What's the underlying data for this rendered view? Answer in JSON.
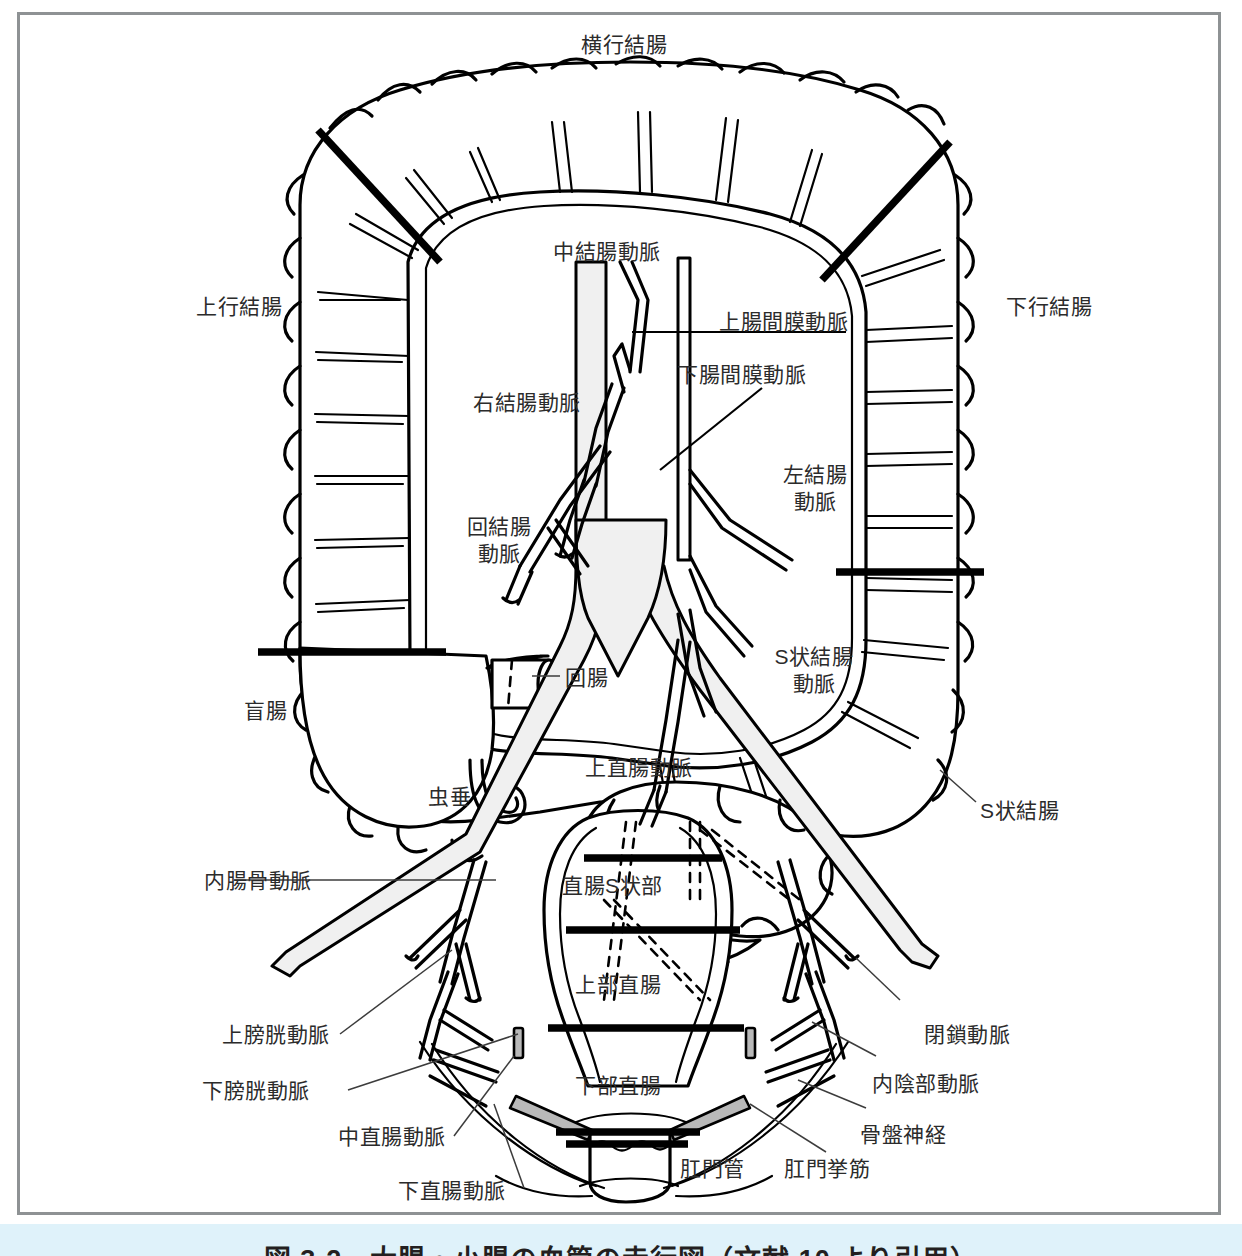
{
  "figure": {
    "title": "大腸・小腸の血管の走行図",
    "caption": "図 3-2　大腸・小腸の血管の走行図（文献 10 より引用）",
    "frame_color": "#8e9294",
    "caption_band_color": "#dff2fa",
    "line_color": "#000000",
    "vessel_fill": "#f0f0f0",
    "label_color": "#2b2b2b"
  },
  "labels": {
    "transverse_colon": "横行結腸",
    "ascending_colon": "上行結腸",
    "descending_colon": "下行結腸",
    "middle_colic_artery": "中結腸動脈",
    "superior_mesenteric_artery": "上腸間膜動脈",
    "inferior_mesenteric_artery": "下腸間膜動脈",
    "right_colic_artery": "右結腸動脈",
    "ileocolic_artery_l1": "回結腸",
    "ileocolic_artery_l2": "動脈",
    "left_colic_artery_l1": "左結腸",
    "left_colic_artery_l2": "動脈",
    "sigmoid_artery_l1": "S状結腸",
    "sigmoid_artery_l2": "動脈",
    "cecum": "盲腸",
    "ileum": "回腸",
    "appendix": "虫垂",
    "sigmoid_colon": "S状結腸",
    "superior_rectal_artery": "上直腸動脈",
    "rectosigmoid": "直腸S状部",
    "upper_rectum": "上部直腸",
    "lower_rectum": "下部直腸",
    "internal_iliac_artery": "内腸骨動脈",
    "superior_vesical_artery": "上膀胱動脈",
    "inferior_vesical_artery": "下膀胱動脈",
    "middle_rectal_artery": "中直腸動脈",
    "inferior_rectal_artery": "下直腸動脈",
    "obturator_artery": "閉鎖動脈",
    "internal_pudendal_artery": "内陰部動脈",
    "pelvic_nerve": "骨盤神経",
    "anal_canal": "肛門管",
    "levator_ani": "肛門挙筋"
  }
}
